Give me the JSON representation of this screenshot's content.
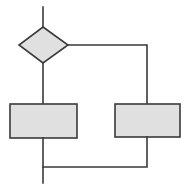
{
  "diagram": {
    "type": "flowchart",
    "colors": {
      "fill": "#e0e0e0",
      "stroke": "#3a3a3a",
      "background": "#ffffff"
    },
    "nodes": [
      {
        "id": "decision",
        "shape": "diamond",
        "label": ""
      },
      {
        "id": "process-left",
        "shape": "rectangle",
        "label": ""
      },
      {
        "id": "process-right",
        "shape": "rectangle",
        "label": ""
      }
    ],
    "edges": [
      {
        "from": "entry",
        "to": "decision"
      },
      {
        "from": "decision",
        "to": "process-left",
        "side": "bottom"
      },
      {
        "from": "decision",
        "to": "process-right",
        "side": "right"
      },
      {
        "from": "process-left",
        "to": "merge"
      },
      {
        "from": "process-right",
        "to": "merge"
      },
      {
        "from": "merge",
        "to": "exit"
      }
    ]
  }
}
